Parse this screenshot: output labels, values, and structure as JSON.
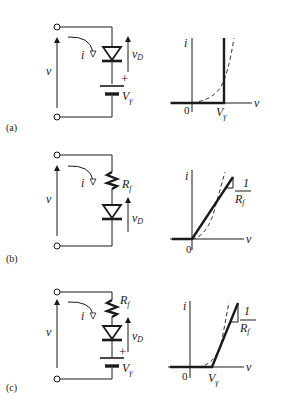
{
  "panels": [
    {
      "id": "a",
      "tag": "(a)",
      "circuit": {
        "voltage_label": "v",
        "current_label": "i",
        "diode_voltage_label": "v",
        "diode_voltage_sub": "D",
        "plus_sign": "+",
        "battery_label": "V",
        "battery_sub": "γ",
        "components": [
          "ideal-diode",
          "battery"
        ]
      },
      "graph": {
        "y_label": "i",
        "x_label": "v",
        "origin_label": "0",
        "tick_label": "V",
        "tick_sub": "γ",
        "model": "ideal diode with offset voltage (vertical at Vγ)"
      }
    },
    {
      "id": "b",
      "tag": "(b)",
      "circuit": {
        "voltage_label": "v",
        "current_label": "i",
        "resistor_label": "R",
        "resistor_sub": "f",
        "diode_voltage_label": "v",
        "diode_voltage_sub": "D",
        "components": [
          "resistor",
          "ideal-diode"
        ]
      },
      "graph": {
        "y_label": "i",
        "x_label": "v",
        "origin_label": "0",
        "slope_num": "1",
        "slope_den": "R",
        "slope_den_sub": "f",
        "model": "ideal diode with forward resistance (line through origin, slope 1/Rf)"
      }
    },
    {
      "id": "c",
      "tag": "(c)",
      "circuit": {
        "voltage_label": "v",
        "current_label": "i",
        "resistor_label": "R",
        "resistor_sub": "f",
        "diode_voltage_label": "v",
        "diode_voltage_sub": "D",
        "plus_sign": "+",
        "battery_label": "V",
        "battery_sub": "γ",
        "components": [
          "resistor",
          "ideal-diode",
          "battery"
        ]
      },
      "graph": {
        "y_label": "i",
        "x_label": "v",
        "origin_label": "0",
        "tick_label": "V",
        "tick_sub": "γ",
        "slope_num": "1",
        "slope_den": "R",
        "slope_den_sub": "f",
        "model": "piecewise-linear: offset Vγ plus slope 1/Rf"
      }
    }
  ]
}
